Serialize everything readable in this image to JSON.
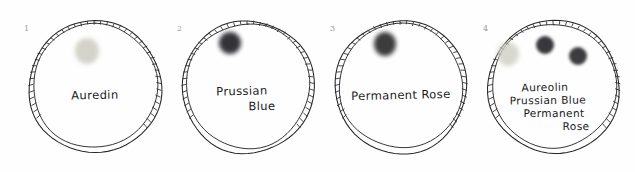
{
  "figure": {
    "background_color": "#fefefe",
    "ink_color": "#262626",
    "number_color": "#9a9a9a",
    "circle_count": 4
  },
  "circles": [
    {
      "number": "1",
      "label_lines": [
        "Auredin"
      ],
      "cx": 95,
      "cy": 87,
      "r": 66,
      "blobs": [
        {
          "name": "aureolin-blob",
          "cx": 87,
          "cy": 51,
          "rx": 12,
          "ry": 13,
          "color": "#c9c9bd",
          "opacity": 0.8
        }
      ]
    },
    {
      "number": "2",
      "label_lines": [
        "Prussian",
        "Blue"
      ],
      "cx": 248,
      "cy": 87,
      "r": 66,
      "blobs": [
        {
          "name": "prussian-blue-blob",
          "cx": 230,
          "cy": 43,
          "rx": 11,
          "ry": 11,
          "color": "#2c2c2e",
          "opacity": 0.95
        }
      ]
    },
    {
      "number": "3",
      "label_lines": [
        "Permanent Rose"
      ],
      "cx": 401,
      "cy": 87,
      "r": 66,
      "blobs": [
        {
          "name": "permanent-rose-blob",
          "cx": 385,
          "cy": 44,
          "rx": 11,
          "ry": 12,
          "color": "#313133",
          "opacity": 0.95
        }
      ]
    },
    {
      "number": "4",
      "label_lines": [
        "Aureolin",
        "Prussian Blue",
        "Permanent",
        "Rose"
      ],
      "cx": 554,
      "cy": 87,
      "r": 66,
      "blobs": [
        {
          "name": "aureolin-blob",
          "cx": 508,
          "cy": 54,
          "rx": 11,
          "ry": 12,
          "color": "#cfcfc4",
          "opacity": 0.8
        },
        {
          "name": "prussian-blue-blob",
          "cx": 545,
          "cy": 45,
          "rx": 9,
          "ry": 9,
          "color": "#2e2e30",
          "opacity": 0.95
        },
        {
          "name": "permanent-rose-blob",
          "cx": 578,
          "cy": 56,
          "rx": 9,
          "ry": 9,
          "color": "#333335",
          "opacity": 0.95
        }
      ]
    }
  ],
  "pigments": [
    "Aureolin",
    "Prussian Blue",
    "Permanent Rose"
  ]
}
